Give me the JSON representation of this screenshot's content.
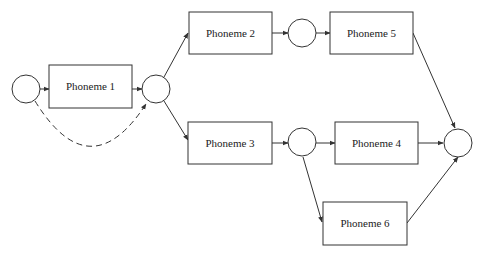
{
  "diagram": {
    "type": "phoneme-lattice",
    "nodes": [
      {
        "id": "s0",
        "kind": "state",
        "cx": 26,
        "cy": 89,
        "r": 14
      },
      {
        "id": "s1",
        "kind": "state",
        "cx": 156,
        "cy": 89,
        "r": 14
      },
      {
        "id": "s2",
        "kind": "state",
        "cx": 302,
        "cy": 33,
        "r": 14
      },
      {
        "id": "s3",
        "kind": "state",
        "cx": 302,
        "cy": 142,
        "r": 14
      },
      {
        "id": "s4",
        "kind": "state",
        "cx": 458,
        "cy": 143,
        "r": 14
      }
    ],
    "boxes": [
      {
        "id": "p1",
        "label": "Phoneme 1",
        "x": 49,
        "y": 65,
        "w": 83,
        "h": 43
      },
      {
        "id": "p2",
        "label": "Phoneme 2",
        "x": 189,
        "y": 12,
        "w": 83,
        "h": 42
      },
      {
        "id": "p5",
        "label": "Phoneme 5",
        "x": 330,
        "y": 12,
        "w": 83,
        "h": 42
      },
      {
        "id": "p3",
        "label": "Phoneme 3",
        "x": 188,
        "y": 122,
        "w": 84,
        "h": 42
      },
      {
        "id": "p4",
        "label": "Phoneme 4",
        "x": 335,
        "y": 122,
        "w": 83,
        "h": 42
      },
      {
        "id": "p6",
        "label": "Phoneme 6",
        "x": 323,
        "y": 202,
        "w": 84,
        "h": 43
      }
    ],
    "edges": [
      {
        "from": "s0",
        "to": "p1",
        "style": "solid"
      },
      {
        "from": "p1",
        "to": "s1",
        "style": "solid"
      },
      {
        "from": "s0",
        "to": "s1",
        "style": "dashed",
        "note": "skip arc"
      },
      {
        "from": "s1",
        "to": "p2",
        "style": "solid"
      },
      {
        "from": "s1",
        "to": "p3",
        "style": "solid"
      },
      {
        "from": "p2",
        "to": "s2",
        "style": "solid"
      },
      {
        "from": "s2",
        "to": "p5",
        "style": "solid"
      },
      {
        "from": "p5",
        "to": "s4",
        "style": "solid"
      },
      {
        "from": "p3",
        "to": "s3",
        "style": "solid"
      },
      {
        "from": "s3",
        "to": "p4",
        "style": "solid"
      },
      {
        "from": "s3",
        "to": "p6",
        "style": "solid"
      },
      {
        "from": "p4",
        "to": "s4",
        "style": "solid"
      },
      {
        "from": "p6",
        "to": "s4",
        "style": "solid"
      }
    ],
    "colors": {
      "stroke": "#333333",
      "background": "#ffffff",
      "text": "#222222"
    }
  }
}
